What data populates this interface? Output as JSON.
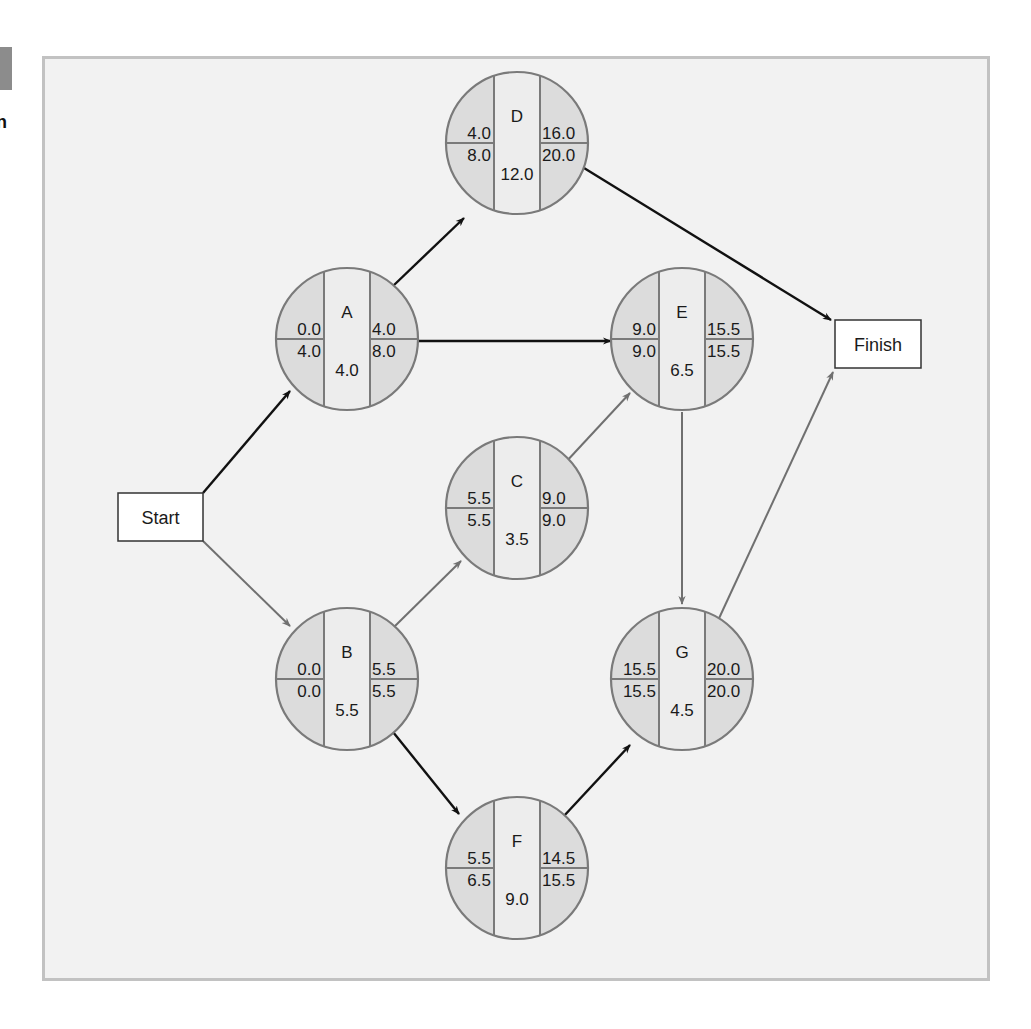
{
  "figure": {
    "side_letter": "n",
    "start_label": "Start",
    "finish_label": "Finish",
    "colors": {
      "frame_bg": "#f2f2f2",
      "frame_border": "#c2c2c2",
      "node_side_fill": "#dcdcdc",
      "node_center_fill": "#ededed",
      "node_stroke": "#7a7a7a",
      "critical_edge": "#707070",
      "noncritical_edge": "#111111"
    }
  },
  "nodes": [
    {
      "id": "D",
      "name": "D",
      "es": "4.0",
      "ls": "8.0",
      "duration": "12.0",
      "ef": "16.0",
      "lf": "20.0",
      "cx": 517,
      "cy": 143,
      "critical": false
    },
    {
      "id": "A",
      "name": "A",
      "es": "0.0",
      "ls": "4.0",
      "duration": "4.0",
      "ef": "4.0",
      "lf": "8.0",
      "cx": 347,
      "cy": 339,
      "critical": false
    },
    {
      "id": "E",
      "name": "E",
      "es": "9.0",
      "ls": "9.0",
      "duration": "6.5",
      "ef": "15.5",
      "lf": "15.5",
      "cx": 682,
      "cy": 339,
      "critical": true
    },
    {
      "id": "C",
      "name": "C",
      "es": "5.5",
      "ls": "5.5",
      "duration": "3.5",
      "ef": "9.0",
      "lf": "9.0",
      "cx": 517,
      "cy": 508,
      "critical": true
    },
    {
      "id": "B",
      "name": "B",
      "es": "0.0",
      "ls": "0.0",
      "duration": "5.5",
      "ef": "5.5",
      "lf": "5.5",
      "cx": 347,
      "cy": 679,
      "critical": true
    },
    {
      "id": "G",
      "name": "G",
      "es": "15.5",
      "ls": "15.5",
      "duration": "4.5",
      "ef": "20.0",
      "lf": "20.0",
      "cx": 682,
      "cy": 679,
      "critical": true
    },
    {
      "id": "F",
      "name": "F",
      "es": "5.5",
      "ls": "6.5",
      "duration": "9.0",
      "ef": "14.5",
      "lf": "15.5",
      "cx": 517,
      "cy": 868,
      "critical": false
    }
  ],
  "edges": [
    {
      "from": "Start",
      "to": "A",
      "critical": false,
      "x1": 203,
      "y1": 493,
      "x2": 290,
      "y2": 391
    },
    {
      "from": "Start",
      "to": "B",
      "critical": true,
      "x1": 203,
      "y1": 541,
      "x2": 290,
      "y2": 626
    },
    {
      "from": "A",
      "to": "D",
      "critical": false,
      "x1": 393,
      "y1": 286,
      "x2": 464,
      "y2": 218
    },
    {
      "from": "A",
      "to": "E",
      "critical": false,
      "x1": 418,
      "y1": 341,
      "x2": 611,
      "y2": 341
    },
    {
      "from": "D",
      "to": "Finish",
      "critical": false,
      "x1": 584,
      "y1": 168,
      "x2": 831,
      "y2": 320
    },
    {
      "from": "C",
      "to": "E",
      "critical": true,
      "x1": 565,
      "y1": 463,
      "x2": 630,
      "y2": 393
    },
    {
      "from": "B",
      "to": "C",
      "critical": true,
      "x1": 394,
      "y1": 627,
      "x2": 461,
      "y2": 561
    },
    {
      "from": "B",
      "to": "F",
      "critical": false,
      "x1": 393,
      "y1": 732,
      "x2": 459,
      "y2": 814
    },
    {
      "from": "E",
      "to": "G",
      "critical": true,
      "x1": 682,
      "y1": 412,
      "x2": 682,
      "y2": 604
    },
    {
      "from": "F",
      "to": "G",
      "critical": false,
      "x1": 563,
      "y1": 817,
      "x2": 630,
      "y2": 745
    },
    {
      "from": "G",
      "to": "Finish",
      "critical": true,
      "x1": 715,
      "y1": 627,
      "x2": 833,
      "y2": 372
    }
  ]
}
